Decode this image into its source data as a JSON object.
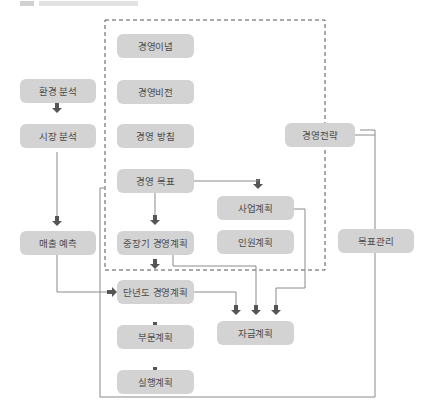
{
  "diagram": {
    "colors": {
      "node_fill": "#d3d3d3",
      "node_text": "#4a4a4a",
      "line": "#8a8a8a",
      "arrow": "#555555",
      "dashed_border": "#555555"
    },
    "nodes": {
      "mission": "경영이념",
      "vision": "경영비전",
      "policy": "경영 방침",
      "goal": "경영 목표",
      "midterm_plan": "중장기 경영계획",
      "annual_plan": "단년도 경영계획",
      "division_plan": "부문계획",
      "execution_plan": "실행계획",
      "env_analysis": "환경 분석",
      "market_analysis": "시장 분석",
      "sales_forecast": "매출 예측",
      "strategy": "경영전략",
      "business_plan": "사업계획",
      "hr_plan": "인원계획",
      "finance_plan": "자금계획",
      "goal_management": "목표관리"
    }
  }
}
